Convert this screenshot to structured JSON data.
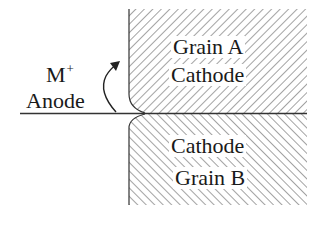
{
  "diagram": {
    "grain_a": {
      "line1": "Grain A",
      "line2": "Cathode"
    },
    "grain_b": {
      "line1": "Cathode",
      "line2": "Grain B"
    },
    "anode_label": {
      "ion": "M",
      "charge": "+",
      "site": "Anode"
    },
    "colors": {
      "ink": "#1a1a1a",
      "hatch": "#555555",
      "background": "#ffffff"
    }
  }
}
